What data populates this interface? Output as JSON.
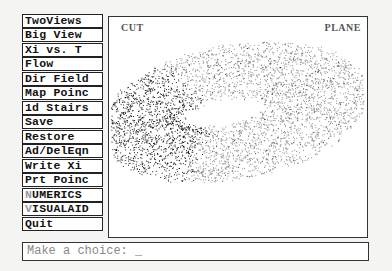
{
  "menu": {
    "items": [
      {
        "label": "TwoViews"
      },
      {
        "label": "Big View"
      },
      {
        "label": "Xi vs. T"
      },
      {
        "label": "Flow"
      },
      {
        "label": "Dir Field"
      },
      {
        "label": "Map Poinc"
      },
      {
        "label": "1d Stairs"
      },
      {
        "label": "Save"
      },
      {
        "label": "Restore"
      },
      {
        "label": "Ad/DelEqn"
      },
      {
        "label": "Write Xi"
      },
      {
        "label": "Prt Poinc"
      },
      {
        "label": "NUMERICS",
        "first": "N",
        "rest": "UMERICS"
      },
      {
        "label": "VISUALAID",
        "first": "V",
        "rest": "ISUALAID"
      },
      {
        "label": "Quit"
      }
    ]
  },
  "plot": {
    "left_label": "CUT",
    "right_label": "PLANE",
    "type": "poincare-scatter"
  },
  "prompt": {
    "text": "Make a choice: _"
  }
}
